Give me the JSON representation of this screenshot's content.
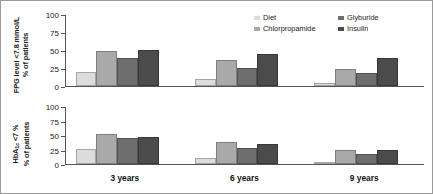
{
  "chart_data": {
    "type": "bar",
    "title": "",
    "categories": [
      "3 years",
      "6 years",
      "9 years"
    ],
    "xlabel": "",
    "grid": false,
    "legend_position": "top-right",
    "legend_entries": [
      "Diet",
      "Chlorpropamide",
      "Glyburide",
      "Insulin"
    ],
    "series_colors": [
      "#dcdcdc",
      "#a9a9a9",
      "#6e6e6e",
      "#4b4b4b"
    ],
    "panels": [
      {
        "id": "fpg",
        "ylabel_line1": "FPG level <7.8 mmol/L",
        "ylabel_line2": "% of patients",
        "ylim": [
          0,
          100
        ],
        "yticks": [
          100,
          75,
          50,
          25,
          0
        ],
        "series": [
          {
            "name": "Diet",
            "values": [
              20,
              10,
              4
            ]
          },
          {
            "name": "Chlorpropamide",
            "values": [
              50,
              36,
              24
            ]
          },
          {
            "name": "Glyburide",
            "values": [
              40,
              25,
              19
            ]
          },
          {
            "name": "Insulin",
            "values": [
              51,
              45,
              39
            ]
          }
        ]
      },
      {
        "id": "hba1c",
        "ylabel_line1": "HbA1c <7 %",
        "ylabel_line2": "% of patients",
        "ylim": [
          0,
          100
        ],
        "yticks": [
          100,
          75,
          50,
          25,
          0
        ],
        "series": [
          {
            "name": "Diet",
            "values": [
              26,
              11,
              3
            ]
          },
          {
            "name": "Chlorpropamide",
            "values": [
              53,
              38,
              25
            ]
          },
          {
            "name": "Glyburide",
            "values": [
              45,
              28,
              17
            ]
          },
          {
            "name": "Insulin",
            "values": [
              47,
              35,
              25
            ]
          }
        ]
      }
    ]
  },
  "axes": {
    "tick_100": "100",
    "tick_75": "75",
    "tick_50": "50",
    "tick_25": "25",
    "tick_0": "0"
  },
  "ylabels": {
    "top_line1_a": "FPG level <7.8 mmol/L",
    "top_line2": "% of patients",
    "bottom_line1_a": "HbA",
    "bottom_line1_sub": "1c",
    "bottom_line1_b": " <7 %",
    "bottom_line2": "% of patients"
  },
  "legend": {
    "items": [
      {
        "label": "Diet",
        "color": "#dcdcdc"
      },
      {
        "label": "Glyburide",
        "color": "#6e6e6e"
      },
      {
        "label": "Chlorpropamide",
        "color": "#a9a9a9"
      },
      {
        "label": "Insulin",
        "color": "#4b4b4b"
      }
    ]
  },
  "xaxis": {
    "labels": [
      "3 years",
      "6 years",
      "9 years"
    ]
  }
}
